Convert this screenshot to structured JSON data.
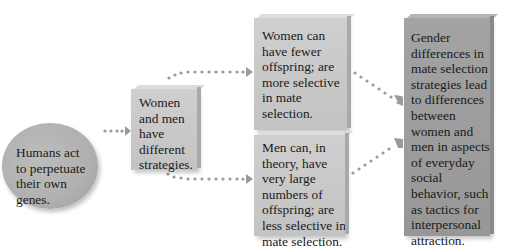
{
  "diagram": {
    "type": "flowchart",
    "colors": {
      "node_fill": "#c8c8c8",
      "circle_fill": "#b0b0b0",
      "final_fill": "#9c9c9c",
      "arrow_dots": "#9a9a9a",
      "text": "#1a1a1a"
    },
    "nodes": [
      {
        "id": "premise",
        "shape": "circle",
        "lines": [
          "Humans act",
          "to perpetuate",
          "their own",
          "genes."
        ]
      },
      {
        "id": "strategies",
        "shape": "box",
        "lines": [
          "Women",
          "and men",
          "have",
          "different",
          "strategies."
        ]
      },
      {
        "id": "women",
        "shape": "box",
        "lines": [
          "Women can",
          "have fewer",
          "offspring; are",
          "more selective",
          "in mate",
          "selection."
        ]
      },
      {
        "id": "men",
        "shape": "box",
        "lines": [
          "Men can, in",
          "theory, have",
          "very large",
          "numbers of",
          "offspring; are",
          "less selective in",
          "mate selection."
        ]
      },
      {
        "id": "conclusion",
        "shape": "box",
        "lines": [
          "Gender",
          "differences in",
          "mate selection",
          "strategies lead",
          "to differences",
          "between",
          "women and",
          "men in aspects",
          "of everyday",
          "social",
          "behavior, such",
          "as tactics for",
          "interpersonal",
          "attraction."
        ]
      }
    ],
    "edges": [
      {
        "from": "premise",
        "to": "strategies",
        "style": "dotted-arrow"
      },
      {
        "from": "strategies",
        "to": "women",
        "style": "dotted-arrow"
      },
      {
        "from": "strategies",
        "to": "men",
        "style": "dotted-arrow"
      },
      {
        "from": "women",
        "to": "conclusion",
        "style": "dotted-arrow"
      },
      {
        "from": "men",
        "to": "conclusion",
        "style": "dotted-arrow"
      }
    ]
  }
}
